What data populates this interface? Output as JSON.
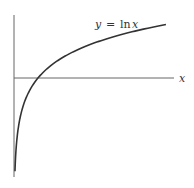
{
  "chart_data": {
    "type": "line",
    "title": "",
    "function": "y = ln x",
    "curve_label": {
      "y": "y",
      "eq": "=",
      "fn": "ln",
      "x": "x"
    },
    "xlabel": "x",
    "ylabel": "",
    "x_domain": [
      0.04,
      6.33
    ],
    "y_range_approx": [
      -3.2,
      1.85
    ],
    "x_intercept": 1,
    "grid": false,
    "legend": "none",
    "series": [
      {
        "name": "y = ln x",
        "x": [
          0.04,
          0.1,
          0.25,
          0.5,
          1,
          2,
          3,
          4,
          5,
          6.33
        ],
        "values": [
          -3.22,
          -2.3,
          -1.39,
          -0.69,
          0,
          0.69,
          1.1,
          1.39,
          1.61,
          1.85
        ]
      }
    ]
  },
  "colors": {
    "axis": "#555555",
    "curve": "#333333",
    "background": "#ffffff"
  }
}
